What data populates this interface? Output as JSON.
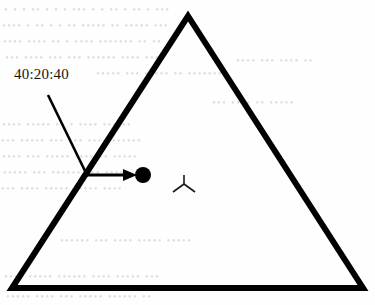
{
  "figure": {
    "type": "ternary-diagram",
    "background_color": "#fefefe",
    "ink_color": "#000000",
    "ghost_text_color": "#d9d9dc"
  },
  "triangle": {
    "name": "ternary-triangle",
    "apex": [
      188,
      16
    ],
    "bottom_left": [
      12,
      288
    ],
    "bottom_right": [
      363,
      288
    ],
    "stroke_width": 6,
    "stroke_color": "#000000",
    "fill": "none"
  },
  "annotation": {
    "label_text": "40:20:40",
    "label_position": [
      14,
      80
    ],
    "leader_line": {
      "name": "leader-line",
      "from": [
        48,
        95
      ],
      "to": [
        86,
        173
      ],
      "stroke_width": 2.6
    },
    "arrow": {
      "name": "annotation-arrow",
      "shaft_from": [
        87,
        175
      ],
      "shaft_to": [
        128,
        175
      ],
      "head_tip": [
        137,
        175
      ],
      "stroke_width": 3
    }
  },
  "data_point": {
    "name": "composition-point",
    "center": [
      143,
      175
    ],
    "radius": 8,
    "fill": "#000000",
    "composition": "40:20:40"
  },
  "marker_symbol": {
    "name": "tripod-symbol",
    "center": [
      184,
      184
    ],
    "description": "three-pronged Y marker: vertical stem up, two legs down-left and down-right",
    "stem_top": [
      184,
      175
    ],
    "leg_left_end": [
      173,
      192
    ],
    "leg_right_end": [
      195,
      192
    ],
    "stroke_width": 1.6
  },
  "chart_data": {
    "type": "scatter",
    "title": "",
    "xlabel": "",
    "ylabel": "",
    "coordinate_system": "ternary",
    "axis_ranges": [
      [
        0,
        100
      ],
      [
        0,
        100
      ],
      [
        0,
        100
      ]
    ],
    "grid": false,
    "legend": "none",
    "points": [
      {
        "label": "40:20:40",
        "components": [
          40,
          20,
          40
        ],
        "marker": "filled-circle",
        "pixel_position": [
          143,
          175
        ]
      }
    ],
    "annotations": [
      {
        "text": "40:20:40",
        "target_pixel": [
          143,
          175
        ],
        "text_pixel": [
          14,
          80
        ]
      }
    ]
  },
  "ghost_text": {
    "note": "faint scanner bleed-through from reverse page; illegible",
    "lines": [
      {
        "text": "• • •   •• • •  • •••  • •  •• • ••  • •••",
        "x": 4,
        "y": 3,
        "size": 11,
        "rotate": 0
      },
      {
        "text": "•••• • ••   • • •• •••••  ••  •••••  •••",
        "x": 2,
        "y": 19,
        "size": 11,
        "rotate": 0
      },
      {
        "text": "••••  ••••  •• • ••••  ••••••• •• ••",
        "x": 3,
        "y": 35,
        "size": 11,
        "rotate": 0
      },
      {
        "text": "••• ••••  ••• ••• •••••• •••• ••••",
        "x": 5,
        "y": 51,
        "size": 11,
        "rotate": 0
      },
      {
        "text": "••••• •••  ••••• •• •••••••",
        "x": 96,
        "y": 67,
        "size": 11,
        "rotate": 0
      },
      {
        "text": "•••• ••••• •• • •••• ••• ••",
        "x": 2,
        "y": 118,
        "size": 11,
        "rotate": 0
      },
      {
        "text": "••• ••••• ••• ••• •••• ••••••",
        "x": 1,
        "y": 134,
        "size": 11,
        "rotate": 0
      },
      {
        "text": "••••  ••• ••••• •••• •• •••••",
        "x": 2,
        "y": 150,
        "size": 11,
        "rotate": 0
      },
      {
        "text": "••••• •••  •••••• ••• ••••",
        "x": 3,
        "y": 166,
        "size": 11,
        "rotate": 0
      },
      {
        "text": "••• •••• ••••• ••••• ••••",
        "x": 1,
        "y": 182,
        "size": 11,
        "rotate": 0
      },
      {
        "text": "•••••• ••• •••• ••••• •••••",
        "x": 60,
        "y": 234,
        "size": 11,
        "rotate": 0
      },
      {
        "text": "•••• ••••• •••••• •••• ••••• •••",
        "x": 4,
        "y": 270,
        "size": 11,
        "rotate": 0
      },
      {
        "text": "••••• •••• ••• ••••• •••••• ••",
        "x": 6,
        "y": 290,
        "size": 11,
        "rotate": 0
      },
      {
        "text": "••• •••• •• •••••",
        "x": 212,
        "y": 96,
        "size": 11,
        "rotate": 0
      },
      {
        "text": "•••• ••• •••• ••",
        "x": 236,
        "y": 54,
        "size": 11,
        "rotate": 0
      }
    ]
  }
}
